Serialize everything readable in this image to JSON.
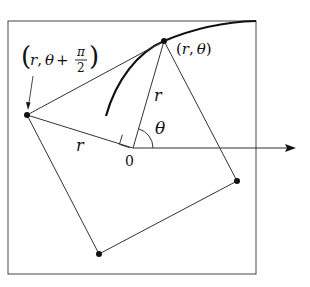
{
  "figure": {
    "colors": {
      "stroke": "#333333",
      "curve": "#111111",
      "background": "#ffffff"
    },
    "points": {
      "origin": {
        "label": "0",
        "x": 133,
        "y": 148
      },
      "p": {
        "label_r": "r",
        "label_theta": "θ",
        "x": 164,
        "y": 41
      },
      "q": {
        "label_r": "r",
        "label_theta": "θ",
        "label_plus": "+",
        "label_pi": "π",
        "label_two": "2",
        "x": 27,
        "y": 115
      },
      "bottom": {
        "x": 99,
        "y": 254
      },
      "right": {
        "x": 237,
        "y": 181
      }
    },
    "labels": {
      "p_open": "(",
      "p_comma": ",",
      "p_close": ")",
      "q_open": "(",
      "q_close": ")",
      "segment_r_vertical": "r",
      "segment_r_left": "r",
      "angle_theta": "θ",
      "origin": "0"
    }
  }
}
